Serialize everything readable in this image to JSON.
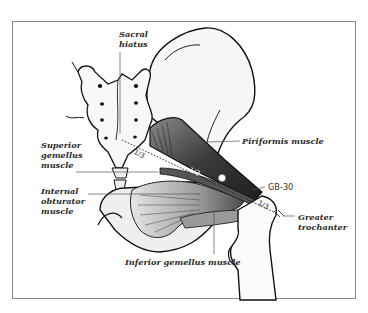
{
  "figure": {
    "title": "",
    "labels": {
      "sacral_hiatus_line1": "Sacral",
      "sacral_hiatus_line2": "hiatus",
      "superior_gemellus_line1": "Superior",
      "superior_gemellus_line2": "gemellus",
      "superior_gemellus_line3": "muscle",
      "internal_obturator_line1": "Internal",
      "internal_obturator_line2": "obturator",
      "internal_obturator_line3": "muscle",
      "piriformis": "Piriformis muscle",
      "gb30": "GB-30",
      "greater_trochanter_line1": "Greater",
      "greater_trochanter_line2": "trochanter",
      "inferior_gemellus": "Inferior gemellus muscle"
    },
    "fractions": {
      "left": "1/3",
      "middle": "1/3",
      "right": "1/3"
    },
    "colors": {
      "frame": "#8a8a8a",
      "outline": "#111111",
      "muscle_dark": "#3a3a3a",
      "muscle_mid": "#7a7a7a",
      "bone_fill": "#f4f4f4",
      "leader_line": "#555555",
      "point_marker": "#ffffff"
    }
  }
}
